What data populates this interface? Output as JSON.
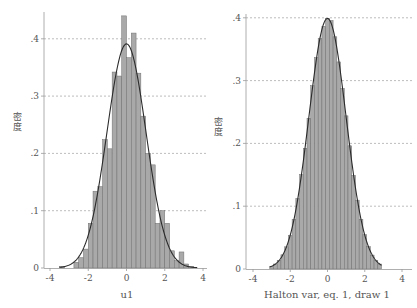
{
  "chart_data": [
    {
      "type": "bar",
      "subtype": "histogram_with_normal_density",
      "title": "",
      "xlabel": "u1",
      "ylabel": "密度",
      "xlim": [
        -4,
        4
      ],
      "ylim": [
        0,
        0.45
      ],
      "xticks": [
        -4,
        -2,
        0,
        2,
        4
      ],
      "xtick_labels": [
        "-4",
        "-2",
        "0",
        "2",
        "4"
      ],
      "yticks": [
        0,
        0.1,
        0.2,
        0.3,
        0.4
      ],
      "ytick_labels": [
        "0",
        ".1",
        ".2",
        ".3",
        ".4"
      ],
      "grid": "horizontal dashed",
      "bin_width": 0.25,
      "bins": [
        {
          "x": -3.5,
          "density": 0.003
        },
        {
          "x": -3.25,
          "density": 0.0
        },
        {
          "x": -3.0,
          "density": 0.0
        },
        {
          "x": -2.75,
          "density": 0.01
        },
        {
          "x": -2.5,
          "density": 0.018
        },
        {
          "x": -2.25,
          "density": 0.033
        },
        {
          "x": -2.0,
          "density": 0.078
        },
        {
          "x": -1.75,
          "density": 0.134
        },
        {
          "x": -1.5,
          "density": 0.142
        },
        {
          "x": -1.25,
          "density": 0.224
        },
        {
          "x": -1.0,
          "density": 0.208
        },
        {
          "x": -0.75,
          "density": 0.342
        },
        {
          "x": -0.5,
          "density": 0.335
        },
        {
          "x": -0.25,
          "density": 0.44
        },
        {
          "x": 0.0,
          "density": 0.367
        },
        {
          "x": 0.25,
          "density": 0.41
        },
        {
          "x": 0.5,
          "density": 0.34
        },
        {
          "x": 0.75,
          "density": 0.265
        },
        {
          "x": 1.0,
          "density": 0.2
        },
        {
          "x": 1.25,
          "density": 0.18
        },
        {
          "x": 1.5,
          "density": 0.078
        },
        {
          "x": 1.75,
          "density": 0.1
        },
        {
          "x": 2.0,
          "density": 0.078
        },
        {
          "x": 2.25,
          "density": 0.03
        },
        {
          "x": 2.5,
          "density": 0.013
        },
        {
          "x": 2.75,
          "density": 0.028
        },
        {
          "x": 3.0,
          "density": 0.007
        },
        {
          "x": 3.25,
          "density": 0.003
        }
      ],
      "normal_curve": {
        "mean": 0.0,
        "sd": 1.02,
        "range": [
          -3.5,
          3.7
        ]
      }
    },
    {
      "type": "bar",
      "subtype": "histogram_with_normal_density",
      "title": "",
      "xlabel": "Halton var, eq. 1, draw 1",
      "ylabel": "密度",
      "xlim": [
        -4,
        4
      ],
      "ylim": [
        0,
        0.41
      ],
      "xticks": [
        -4,
        -2,
        0,
        2,
        4
      ],
      "xtick_labels": [
        "-4",
        "-2",
        "0",
        "2",
        "4"
      ],
      "yticks": [
        0,
        0.1,
        0.2,
        0.3,
        0.4
      ],
      "ytick_labels": [
        "0",
        ".1",
        ".2",
        ".3",
        ".4"
      ],
      "grid": "horizontal dashed",
      "bin_width": 0.2,
      "bins_range": [
        -3.1,
        2.9
      ],
      "bins_follow": "standard normal density",
      "normal_curve": {
        "mean": 0.0,
        "sd": 1.0,
        "range": [
          -3.1,
          2.9
        ]
      }
    }
  ],
  "panels": {
    "left": {
      "ylabel": "密度",
      "xlabel": "u1"
    },
    "right": {
      "ylabel": "密度",
      "xlabel": "Halton var, eq. 1, draw 1"
    }
  },
  "colors": {
    "bar_fill": "#a9a9a9",
    "bar_edge": "#6f6f6f",
    "curve": "#2b2b2b",
    "grid": "#a0a0a0",
    "axis": "#9a9a9a"
  }
}
